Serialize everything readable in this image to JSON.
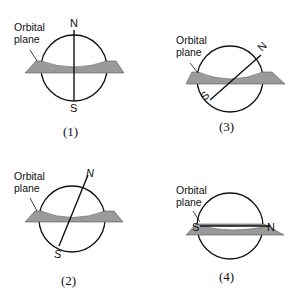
{
  "figure": {
    "plane_color": "#9a9a9a",
    "line_color": "#111111",
    "panels": [
      {
        "id": "1",
        "caption": "(1)",
        "label_line1": "Orbital",
        "label_line2": "plane",
        "north": "N",
        "south": "S",
        "axis_tilt": "perpendicular to orbital plane"
      },
      {
        "id": "3",
        "caption": "(3)",
        "label_line1": "Orbital",
        "label_line2": "plane",
        "north": "N",
        "south": "S",
        "axis_tilt": "about 45 degrees"
      },
      {
        "id": "2",
        "caption": "(2)",
        "label_line1": "Orbital",
        "label_line2": "plane",
        "north": "N",
        "south": "S",
        "axis_tilt": "slight tilt (~23 degrees)"
      },
      {
        "id": "4",
        "caption": "(4)",
        "label_line1": "Orbital",
        "label_line2": "plane",
        "north": "N",
        "south": "S",
        "axis_tilt": "lies in orbital plane"
      }
    ]
  }
}
